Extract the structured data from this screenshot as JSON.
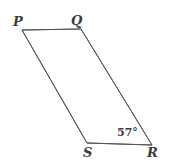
{
  "figure": {
    "kind": "parallelogram",
    "name": "PQRS",
    "background_color": "#ffffff",
    "stroke_color": "#555555",
    "stroke_width": 1,
    "text_color": "#3a3a3a",
    "canvas": {
      "width": 170,
      "height": 167
    },
    "vertices": [
      {
        "id": "P",
        "label": "P",
        "x": 22,
        "y": 30,
        "label_x": 13,
        "label_y": 15
      },
      {
        "id": "Q",
        "label": "Q",
        "x": 81,
        "y": 29,
        "label_x": 71,
        "label_y": 14
      },
      {
        "id": "R",
        "label": "R",
        "x": 152,
        "y": 145,
        "label_x": 147,
        "label_y": 146
      },
      {
        "id": "S",
        "label": "S",
        "x": 87,
        "y": 143,
        "label_x": 83,
        "label_y": 146
      }
    ],
    "edges": [
      {
        "id": "PQ",
        "from": "P",
        "to": "Q"
      },
      {
        "id": "QR",
        "from": "Q",
        "to": "R"
      },
      {
        "id": "RS",
        "from": "R",
        "to": "S"
      },
      {
        "id": "SP",
        "from": "S",
        "to": "P"
      }
    ],
    "angles": [
      {
        "id": "angle-R",
        "at_vertex": "R",
        "value": "57",
        "degree_symbol": "°",
        "text": "57°",
        "label_x": 117,
        "label_y": 127
      }
    ],
    "polygon_points": "22,30 81,29 152,145 87,143"
  }
}
